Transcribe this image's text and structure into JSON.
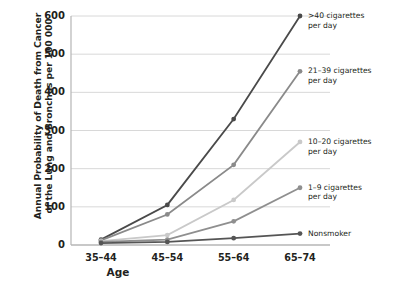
{
  "chart_data": {
    "type": "line",
    "title": "",
    "xlabel": "Age",
    "ylabel": "Annual Probability of Death from Cancer of the Lung and Bronchus per 100 000",
    "ylabel_line1": "Annual Probability of Death from Cancer",
    "ylabel_line2": "of the Lung and Bronchus per 100 000",
    "categories": [
      "35–44",
      "45–54",
      "55–64",
      "65–74"
    ],
    "yticks": [
      0,
      100,
      200,
      300,
      400,
      500,
      600
    ],
    "ylim": [
      0,
      600
    ],
    "grid": true,
    "legend_position": "right-inline",
    "series": [
      {
        "name": ">40 cigarettes per day",
        "label_line1": ">40 cigarettes",
        "label_line2": "per day",
        "color": "#4a4a4a",
        "values": [
          14,
          105,
          330,
          600
        ]
      },
      {
        "name": "21–39 cigarettes per day",
        "label_line1": "21–39 cigarettes",
        "label_line2": "per day",
        "color": "#8a8a8a",
        "values": [
          12,
          80,
          210,
          455
        ]
      },
      {
        "name": "10–20 cigarettes per day",
        "label_line1": "10–20 cigarettes",
        "label_line2": "per day",
        "color": "#c9c9c9",
        "values": [
          10,
          26,
          118,
          270
        ]
      },
      {
        "name": "1–9 cigarettes per day",
        "label_line1": "1–9 cigarettes",
        "label_line2": "per day",
        "color": "#8f8f8f",
        "values": [
          8,
          14,
          62,
          150
        ]
      },
      {
        "name": "Nonsmoker",
        "label_line1": "Nonsmoker",
        "label_line2": "",
        "color": "#555555",
        "values": [
          5,
          8,
          18,
          30
        ]
      }
    ]
  },
  "axes": {
    "tick_labels_y": [
      "600",
      "500",
      "400",
      "300",
      "200",
      "100",
      "0"
    ],
    "tick_labels_x": [
      "35–44",
      "45–54",
      "55–64",
      "65–74"
    ]
  }
}
